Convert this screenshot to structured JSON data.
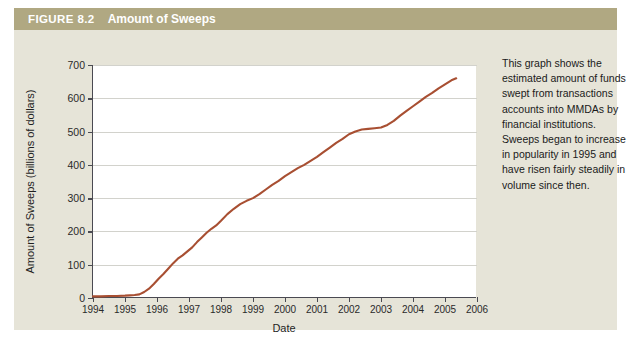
{
  "figure": {
    "number_label": "FIGURE 8.2",
    "title": "Amount of Sweeps",
    "caption": "This graph shows the estimated amount of funds swept from transactions accounts into MMDAs by financial institutions. Sweeps began to increase in popularity in 1995 and have risen fairly steadily in volume since then.",
    "header_bg": "#b0a882",
    "panel_bg": "#e6e4d8",
    "plot_bg": "#ffffff"
  },
  "chart_data": {
    "type": "line",
    "title": "Amount of Sweeps",
    "xlabel": "Date",
    "ylabel": "Amount of Sweeps (billions of dollars)",
    "xlim": [
      1994,
      2006
    ],
    "ylim": [
      0,
      700
    ],
    "xticks": [
      1994,
      1995,
      1996,
      1997,
      1998,
      1999,
      2000,
      2001,
      2002,
      2003,
      2004,
      2005,
      2006
    ],
    "yticks": [
      0,
      100,
      200,
      300,
      400,
      500,
      600,
      700
    ],
    "grid": "horizontal",
    "legend": "none",
    "line_color": "#a84f32",
    "line_width": 2.1,
    "series": [
      {
        "name": "Amount of Sweeps",
        "x": [
          1994.0,
          1994.25,
          1994.5,
          1994.75,
          1995.0,
          1995.15,
          1995.3,
          1995.45,
          1995.6,
          1995.75,
          1995.9,
          1996.05,
          1996.2,
          1996.35,
          1996.5,
          1996.65,
          1996.8,
          1996.95,
          1997.1,
          1997.25,
          1997.4,
          1997.55,
          1997.7,
          1997.85,
          1998.0,
          1998.2,
          1998.4,
          1998.6,
          1998.8,
          1999.0,
          1999.2,
          1999.4,
          1999.6,
          1999.8,
          2000.0,
          2000.2,
          2000.4,
          2000.6,
          2000.8,
          2001.0,
          2001.2,
          2001.4,
          2001.6,
          2001.8,
          2002.0,
          2002.2,
          2002.4,
          2002.6,
          2002.8,
          2003.0,
          2003.2,
          2003.4,
          2003.6,
          2003.8,
          2004.0,
          2004.2,
          2004.4,
          2004.6,
          2004.8,
          2005.0,
          2005.2,
          2005.35
        ],
        "y": [
          5,
          5,
          6,
          6,
          7,
          8,
          9,
          11,
          18,
          28,
          42,
          58,
          72,
          88,
          104,
          118,
          128,
          140,
          152,
          168,
          182,
          196,
          208,
          218,
          232,
          252,
          268,
          282,
          292,
          300,
          312,
          326,
          340,
          352,
          366,
          378,
          390,
          400,
          412,
          424,
          438,
          452,
          466,
          478,
          492,
          500,
          506,
          508,
          510,
          512,
          520,
          532,
          548,
          562,
          576,
          590,
          604,
          616,
          630,
          642,
          654,
          660
        ]
      }
    ]
  }
}
